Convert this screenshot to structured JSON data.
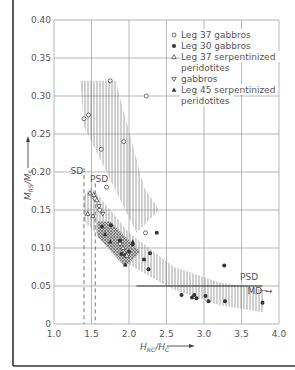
{
  "chart_data": {
    "type": "scatter",
    "title": "",
    "xlabel": "H_RC/H_C",
    "ylabel": "M_RS/M_S",
    "xlim": [
      1.0,
      4.0
    ],
    "ylim": [
      0,
      0.4
    ],
    "x_ticks": [
      "1.0",
      "1.5",
      "2.0",
      "2.5",
      "3.0",
      "3.5",
      "4.0"
    ],
    "y_ticks": [
      "0",
      "0.05",
      "0.10",
      "0.15",
      "0.20",
      "0.25",
      "0.30",
      "0.35",
      "0.40"
    ],
    "grid": true,
    "legend_position": "upper right",
    "series": [
      {
        "name": "Leg 37 gabbros",
        "marker": "open-circle",
        "points": [
          [
            1.4,
            0.27
          ],
          [
            1.46,
            0.275
          ],
          [
            1.75,
            0.32
          ],
          [
            1.63,
            0.23
          ],
          [
            1.93,
            0.24
          ],
          [
            2.23,
            0.3
          ],
          [
            1.55,
            0.165
          ],
          [
            1.7,
            0.18
          ],
          [
            2.22,
            0.12
          ],
          [
            1.98,
            0.092
          ],
          [
            1.61,
            0.15
          ]
        ]
      },
      {
        "name": "Leg 30 gabbros",
        "marker": "filled-circle",
        "points": [
          [
            1.64,
            0.128
          ],
          [
            1.76,
            0.13
          ],
          [
            1.88,
            0.11
          ],
          [
            1.9,
            0.092
          ],
          [
            1.95,
            0.09
          ],
          [
            2.0,
            0.095
          ],
          [
            2.05,
            0.105
          ],
          [
            2.2,
            0.085
          ],
          [
            2.37,
            0.12
          ],
          [
            2.28,
            0.093
          ],
          [
            2.26,
            0.072
          ],
          [
            2.7,
            0.038
          ],
          [
            2.84,
            0.035
          ],
          [
            2.87,
            0.038
          ],
          [
            2.9,
            0.034
          ],
          [
            3.02,
            0.037
          ],
          [
            3.06,
            0.03
          ],
          [
            3.28,
            0.03
          ],
          [
            3.78,
            0.028
          ],
          [
            3.27,
            0.077
          ]
        ]
      },
      {
        "name": "Leg 37 serpentinized peridotites",
        "marker": "open-triangle",
        "points": [
          [
            1.48,
            0.172
          ],
          [
            1.53,
            0.17
          ],
          [
            1.57,
            0.163
          ],
          [
            1.45,
            0.145
          ],
          [
            1.52,
            0.142
          ],
          [
            1.92,
            0.1
          ],
          [
            1.97,
            0.09
          ]
        ]
      },
      {
        "name": "gabbros",
        "marker": "open-triangle-down",
        "points": [
          [
            1.6,
            0.155
          ],
          [
            1.65,
            0.145
          ],
          [
            1.88,
            0.105
          ]
        ]
      },
      {
        "name": "Leg 45 serpentinized peridotites",
        "marker": "filled-triangle",
        "points": [
          [
            1.75,
            0.108
          ],
          [
            1.95,
            0.078
          ],
          [
            2.05,
            0.108
          ],
          [
            1.68,
            0.118
          ]
        ]
      }
    ],
    "regions": [
      {
        "name": "upper-hatched-band",
        "style": "vertical-hatch",
        "polygon": [
          [
            1.35,
            0.32
          ],
          [
            1.82,
            0.32
          ],
          [
            2.2,
            0.18
          ],
          [
            2.4,
            0.15
          ],
          [
            2.1,
            0.12
          ],
          [
            1.55,
            0.23
          ],
          [
            1.4,
            0.26
          ]
        ]
      },
      {
        "name": "lower-hatched-band",
        "style": "vertical-hatch",
        "polygon": [
          [
            1.4,
            0.17
          ],
          [
            1.5,
            0.18
          ],
          [
            2.0,
            0.12
          ],
          [
            2.6,
            0.075
          ],
          [
            3.2,
            0.055
          ],
          [
            3.8,
            0.045
          ],
          [
            3.8,
            0.015
          ],
          [
            3.2,
            0.025
          ],
          [
            2.6,
            0.045
          ],
          [
            2.0,
            0.078
          ],
          [
            1.4,
            0.135
          ]
        ]
      },
      {
        "name": "dark-cross-hatched-band",
        "style": "cross-hatch",
        "polygon": [
          [
            1.58,
            0.135
          ],
          [
            1.75,
            0.135
          ],
          [
            2.15,
            0.095
          ],
          [
            1.95,
            0.075
          ],
          [
            1.58,
            0.115
          ]
        ]
      }
    ],
    "annotations": [
      {
        "text": "SD",
        "x": 1.22,
        "y": 0.198
      },
      {
        "text": "PSD",
        "x": 1.48,
        "y": 0.187
      },
      {
        "text": "PSD",
        "x": 3.48,
        "y": 0.058
      },
      {
        "text": "MD →",
        "x": 3.58,
        "y": 0.04
      }
    ],
    "reference_lines": [
      {
        "type": "vertical-dashed",
        "x": 1.4,
        "y_range": [
          0,
          0.205
        ]
      },
      {
        "type": "vertical-dashed",
        "x": 1.55,
        "y_range": [
          0,
          0.185
        ]
      },
      {
        "type": "horizontal-solid",
        "y": 0.05,
        "x_range": [
          2.1,
          3.78
        ]
      }
    ]
  },
  "legend": [
    "Leg 37 gabbros",
    "Leg 30 gabbros",
    "Leg 37  serpentinized",
    "peridotites",
    "gabbros",
    "Leg 45 serpentinized",
    "peridotites"
  ],
  "labels": {
    "ylabel": "M_RS / M_S",
    "xlabel": "H_RC / H_C"
  },
  "colors": {
    "ink": "#333333",
    "grid": "#9a9a9a",
    "text": "#555555",
    "hatch": "#8a8a8a"
  }
}
